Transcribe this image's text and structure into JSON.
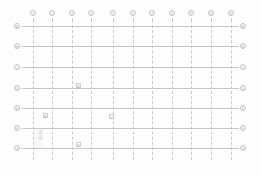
{
  "drawing": {
    "title": "Structural Grid Plan",
    "background_color": "#fdfdfd",
    "line_color": "#c4c4ca",
    "dash_color": "#c9c9cf",
    "bubble_color": "#c0c0c8",
    "text_color": "#b0b0b8"
  },
  "column_grid": {
    "axis": "vertical",
    "bubble_row_y": 13,
    "labels": [
      "1",
      "2",
      "3",
      "4",
      "5",
      "6",
      "7",
      "8",
      "9",
      "10",
      "11"
    ],
    "x_positions": [
      33,
      52,
      72,
      91,
      113,
      133,
      152,
      172,
      191,
      211,
      231
    ],
    "line_top": 20,
    "line_bottom": 160
  },
  "row_grid": {
    "axis": "horizontal",
    "labels_left": [
      "A",
      "B",
      "C",
      "D",
      "E",
      "F",
      "G"
    ],
    "labels_right": [
      "A",
      "B",
      "C",
      "D",
      "E",
      "F",
      "G"
    ],
    "y_positions": [
      26,
      46,
      67,
      88,
      108,
      128,
      148
    ],
    "bubble_left_x": 17,
    "bubble_right_x": 243,
    "line_left": 24,
    "line_right": 238
  },
  "annotations": [
    {
      "name": "marker-p",
      "label": "P",
      "x": 77,
      "y": 84
    },
    {
      "name": "marker-b",
      "label": "B",
      "x": 44,
      "y": 114
    },
    {
      "name": "marker-c",
      "label": "C",
      "x": 110,
      "y": 115
    },
    {
      "name": "marker-s",
      "label": "S",
      "x": 77,
      "y": 143
    }
  ],
  "vertical_notes": [
    {
      "name": "note-left-column",
      "label": "NOTE",
      "x": 38,
      "y": 130
    }
  ],
  "shaded_regions": [
    {
      "name": "region-lower-left",
      "x": 34,
      "y": 129,
      "w": 9,
      "h": 19
    }
  ]
}
